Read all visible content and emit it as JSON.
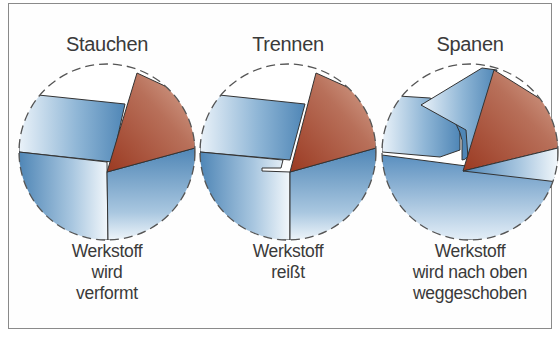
{
  "diagram": {
    "panels": [
      {
        "title": "Stauchen",
        "caption": [
          "Werkstoff",
          "wird",
          "verformt"
        ],
        "illustration": "chip-compression"
      },
      {
        "title": "Trennen",
        "caption": [
          "Werkstoff",
          "reißt"
        ],
        "illustration": "chip-tearing"
      },
      {
        "title": "Spanen",
        "caption": [
          "Werkstoff",
          "wird nach oben",
          "weggeschoben"
        ],
        "illustration": "chip-curling"
      }
    ],
    "colors": {
      "workpiece": "#5a8fbf",
      "workpiece_light": "#e8f1f8",
      "tool": "#a9543a",
      "tool_light": "#d6a48c",
      "outline": "#333333",
      "text": "#3a3a3a",
      "frame": "#8a8a8a"
    }
  }
}
